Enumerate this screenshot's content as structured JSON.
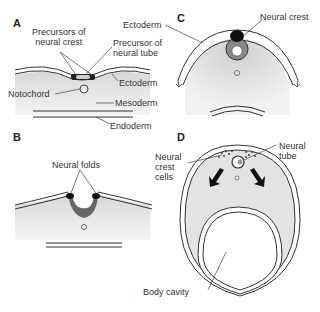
{
  "panels": {
    "a": {
      "letter": "A",
      "labels": {
        "precursors_neural_crest_1": "Precursors of",
        "precursors_neural_crest_2": "neural crest",
        "precursor_neural_tube_1": "Precursor of",
        "precursor_neural_tube_2": "neural tube",
        "ectoderm": "Ectoderm",
        "notochord": "Notochord",
        "mesoderm": "Mesoderm",
        "endoderm": "Endoderm"
      }
    },
    "b": {
      "letter": "B",
      "labels": {
        "neural_folds": "Neural folds"
      }
    },
    "c": {
      "letter": "C",
      "labels": {
        "ectoderm": "Ectoderm",
        "neural_crest": "Neural crest"
      }
    },
    "d": {
      "letter": "D",
      "labels": {
        "neural_crest_cells_1": "Neural",
        "neural_crest_cells_2": "crest",
        "neural_crest_cells_3": "cells",
        "neural_tube_1": "Neural",
        "neural_tube_2": "tube",
        "body_cavity": "Body cavity"
      }
    }
  },
  "colors": {
    "mesoderm_fill": "#e2e2e2",
    "line": "#333333",
    "crest": "#111111",
    "tube": "#8a8a8a"
  }
}
